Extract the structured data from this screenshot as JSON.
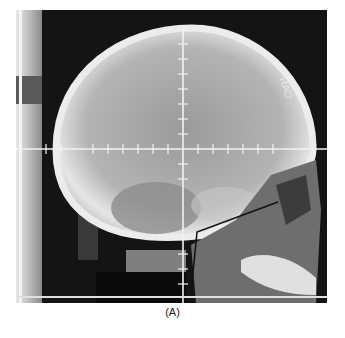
{
  "figure": {
    "caption": "(A)",
    "annotation": "RAO",
    "colors": {
      "background": "#141414",
      "bone": "#d8d8d8",
      "grid": "#f0f0f0",
      "page": "#ffffff"
    }
  }
}
